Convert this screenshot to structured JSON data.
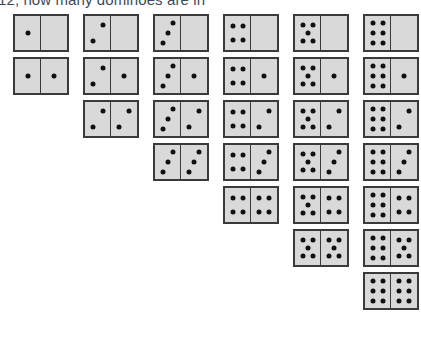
{
  "question": {
    "text": "12, how many dominoes are in"
  },
  "diagram": {
    "name": "double-six-domino-set",
    "total_dominoes": 28,
    "max_pips": 6,
    "colors": {
      "tile_face": "#d9d9d9",
      "tile_border": "#3a3a3a",
      "pip": "#111111",
      "text": "#3b4a5a",
      "background": "#ffffff"
    },
    "geometry": {
      "tile_width": 56,
      "tile_height": 38,
      "row_gap": 5,
      "col_gap": 14,
      "row_height_step": 43,
      "first_row_top": 14,
      "right_edge": 419
    },
    "rows": [
      {
        "index": 0,
        "left": -9,
        "top": 14,
        "dominoes": [
          {
            "left": 0,
            "right": 0
          },
          {
            "left": 1,
            "right": 0
          },
          {
            "left": 2,
            "right": 0
          },
          {
            "left": 3,
            "right": 0
          },
          {
            "left": 4,
            "right": 0
          },
          {
            "left": 5,
            "right": 0
          },
          {
            "left": 6,
            "right": 0
          }
        ]
      },
      {
        "index": 1,
        "left": 61,
        "top": 57,
        "dominoes": [
          {
            "left": 1,
            "right": 1
          },
          {
            "left": 2,
            "right": 1
          },
          {
            "left": 3,
            "right": 1
          },
          {
            "left": 4,
            "right": 1
          },
          {
            "left": 5,
            "right": 1
          },
          {
            "left": 6,
            "right": 1
          }
        ]
      },
      {
        "index": 2,
        "left": 131,
        "top": 100,
        "dominoes": [
          {
            "left": 2,
            "right": 2
          },
          {
            "left": 3,
            "right": 2
          },
          {
            "left": 4,
            "right": 2
          },
          {
            "left": 5,
            "right": 2
          },
          {
            "left": 6,
            "right": 2
          }
        ]
      },
      {
        "index": 3,
        "left": 201,
        "top": 143,
        "dominoes": [
          {
            "left": 3,
            "right": 3
          },
          {
            "left": 4,
            "right": 3
          },
          {
            "left": 5,
            "right": 3
          },
          {
            "left": 6,
            "right": 3
          }
        ]
      },
      {
        "index": 4,
        "left": 271,
        "top": 186,
        "dominoes": [
          {
            "left": 4,
            "right": 4
          },
          {
            "left": 5,
            "right": 4
          },
          {
            "left": 6,
            "right": 4
          }
        ]
      },
      {
        "index": 5,
        "left": 341,
        "top": 229,
        "dominoes": [
          {
            "left": 5,
            "right": 5
          },
          {
            "left": 6,
            "right": 5
          }
        ]
      },
      {
        "index": 6,
        "left": 411,
        "top": 272,
        "dominoes": [
          {
            "left": 6,
            "right": 6
          }
        ]
      }
    ],
    "pip_layouts": {
      "0": [],
      "1": [
        [
          50,
          50
        ]
      ],
      "2": [
        [
          70,
          26
        ],
        [
          30,
          74
        ]
      ],
      "3": [
        [
          70,
          22
        ],
        [
          50,
          50
        ],
        [
          30,
          78
        ]
      ],
      "4": [
        [
          30,
          28
        ],
        [
          70,
          28
        ],
        [
          30,
          72
        ],
        [
          70,
          72
        ]
      ],
      "5": [
        [
          30,
          26
        ],
        [
          70,
          26
        ],
        [
          50,
          50
        ],
        [
          30,
          74
        ],
        [
          70,
          74
        ]
      ],
      "6": [
        [
          30,
          22
        ],
        [
          70,
          22
        ],
        [
          30,
          50
        ],
        [
          70,
          50
        ],
        [
          30,
          78
        ],
        [
          70,
          78
        ]
      ]
    }
  }
}
